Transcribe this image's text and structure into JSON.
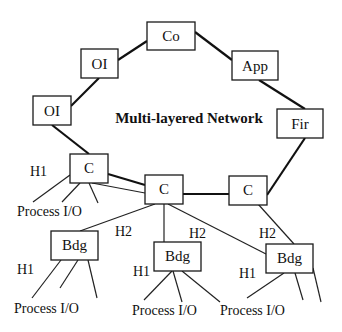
{
  "diagram": {
    "title": "Multi-layered Network",
    "nodes": {
      "co": "Co",
      "oi_upper": "OI",
      "oi_lower": "OI",
      "app": "App",
      "fir": "Fir",
      "c_left": "C",
      "c_middle": "C",
      "c_right": "C",
      "bdg_left": "Bdg",
      "bdg_middle": "Bdg",
      "bdg_right": "Bdg"
    },
    "labels": {
      "h1_c_left": "H1",
      "h2_bdg_left": "H2",
      "h2_bdg_middle": "H2",
      "h2_bdg_right": "H2",
      "h1_bdg_left": "H1",
      "h1_bdg_middle": "H1",
      "h1_bdg_right": "H1",
      "process_io_c_left": "Process I/O",
      "process_io_bdg_left": "Process I/O",
      "process_io_bdg_middle": "Process I/O",
      "process_io_bdg_right": "Process I/O"
    }
  }
}
